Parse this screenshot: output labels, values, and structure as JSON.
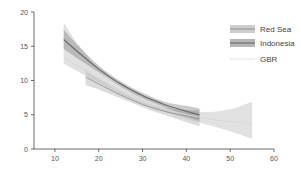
{
  "chart_data": {
    "type": "line",
    "title": "",
    "xlabel": "",
    "ylabel": "",
    "xlim": [
      5,
      60
    ],
    "ylim": [
      0,
      20
    ],
    "x_ticks": [
      10,
      20,
      30,
      40,
      50,
      60
    ],
    "y_ticks": [
      0,
      5,
      10,
      15,
      20
    ],
    "grid": false,
    "legend_position": "upper right",
    "series": [
      {
        "name": "Red Sea",
        "color": "#9a9a9a",
        "band_color": "#bdbdbd",
        "band_opacity": 0.55,
        "x": [
          17,
          20,
          25,
          30,
          35,
          40,
          43
        ],
        "y": [
          10.5,
          9.5,
          7.9,
          6.5,
          5.5,
          4.8,
          4.5
        ],
        "ci_low": [
          9.3,
          8.7,
          7.4,
          6.1,
          5.0,
          3.9,
          3.3
        ],
        "ci_high": [
          11.7,
          10.3,
          8.4,
          6.9,
          6.0,
          5.7,
          5.7
        ]
      },
      {
        "name": "Indonesia",
        "color": "#6e6e6e",
        "band_color": "#8a8a8a",
        "band_opacity": 0.45,
        "x": [
          12,
          15,
          20,
          25,
          30,
          35,
          40,
          43
        ],
        "y": [
          16.0,
          14.3,
          11.7,
          9.5,
          7.8,
          6.5,
          5.5,
          5.0
        ],
        "ci_low": [
          14.6,
          13.3,
          11.2,
          9.1,
          7.4,
          6.1,
          4.7,
          4.1
        ],
        "ci_high": [
          17.4,
          15.3,
          12.2,
          9.9,
          8.2,
          6.9,
          6.3,
          5.9
        ]
      },
      {
        "name": "GBR",
        "color": "#d8d8d8",
        "band_color": "#c4c4c4",
        "band_opacity": 0.5,
        "x": [
          12,
          15,
          20,
          25,
          30,
          35,
          40,
          45,
          50,
          55
        ],
        "y": [
          13.5,
          12.2,
          10.3,
          8.6,
          7.1,
          5.9,
          5.0,
          4.4,
          4.0,
          3.7
        ],
        "ci_low": [
          12.5,
          11.4,
          9.7,
          8.0,
          6.5,
          5.4,
          4.4,
          3.5,
          2.6,
          1.5
        ],
        "ci_high": [
          18.5,
          15.5,
          11.6,
          9.2,
          7.6,
          6.4,
          5.6,
          5.4,
          5.8,
          6.9
        ]
      }
    ]
  },
  "legend": {
    "items": [
      {
        "label": "Red Sea",
        "swatch": "band-with-line"
      },
      {
        "label": "Indonesia",
        "swatch": "band-with-line"
      },
      {
        "label": "GBR",
        "swatch": "line"
      }
    ]
  }
}
